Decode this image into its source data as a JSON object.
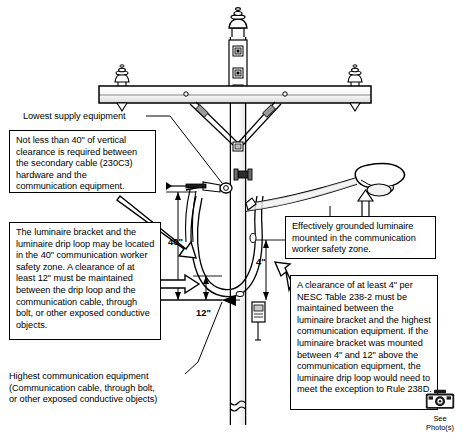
{
  "diagram": {
    "colors": {
      "line": "#000000",
      "background": "#ffffff",
      "fill_light": "#f2f2f2"
    },
    "callouts": [
      {
        "id": "vertical-clearance",
        "text": "Not less than 40\" of vertical clearance is required between the secondary cable (230C3) hardware and the communication equipment."
      },
      {
        "id": "luminaire-bracket",
        "text": "The luminaire bracket and the luminaire drip loop may be located in the 40\" communication worker safety zone. A clearance of at least 12\" must be maintained between the drip loop and the communication cable, through bolt, or other exposed conductive objects."
      },
      {
        "id": "grounded-luminaire",
        "text": "Effectively grounded luminaire mounted in the communication worker safety zone."
      },
      {
        "id": "nesc-clearance",
        "text": "A clearance of at least 4\" per NESC Table 238-2 must be maintained between the luminaire bracket and the highest communication equipment. If the luminaire bracket was mounted between 4\" and 12\" above the communication equipment, the luminaire drip loop would need to meet the exception to Rule 238D."
      }
    ],
    "labels": {
      "lowest_supply_equipment": "Lowest supply equipment",
      "highest_communication_equipment": "Highest communication equipment\n(Communication cable, through bolt,\nor other exposed conductive objects)"
    },
    "dimensions": [
      {
        "id": "vertical-safety-zone",
        "value": "40\""
      },
      {
        "id": "drip-loop-clearance",
        "value": "12\""
      },
      {
        "id": "bracket-clearance",
        "value": "4\""
      }
    ],
    "photo_badge": {
      "icon": "camera-icon",
      "line1": "See",
      "line2": "Photo(s)"
    }
  }
}
